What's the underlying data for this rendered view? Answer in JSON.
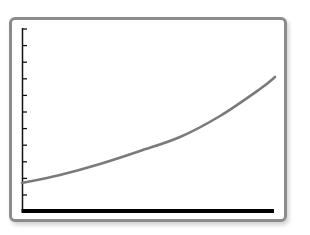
{
  "chart_data": {
    "type": "line",
    "title": "",
    "xlabel": "",
    "ylabel": "",
    "grid": false,
    "legend": null,
    "y_tick_count": 11,
    "x_tick_labels": [],
    "y_tick_labels": [],
    "series": [
      {
        "name": "curve",
        "shape": "exponential growth",
        "color": "#7a7a7a",
        "points_px": [
          [
            22,
            183
          ],
          [
            60,
            175
          ],
          [
            100,
            164
          ],
          [
            140,
            151
          ],
          [
            180,
            137
          ],
          [
            220,
            116
          ],
          [
            260,
            89
          ],
          [
            275,
            77
          ]
        ],
        "x_normalized": [
          0.0,
          0.15,
          0.31,
          0.47,
          0.62,
          0.78,
          0.94,
          1.0
        ],
        "y_normalized": [
          0.15,
          0.19,
          0.25,
          0.31,
          0.39,
          0.5,
          0.65,
          0.72
        ]
      }
    ],
    "xlim": [
      0,
      1
    ],
    "ylim": [
      0,
      1
    ]
  },
  "colors": {
    "frame_border": "#8c8c8c",
    "axis": "#111111",
    "x_axis": "#000000",
    "curve": "#7a7a7a",
    "background": "#ffffff"
  }
}
